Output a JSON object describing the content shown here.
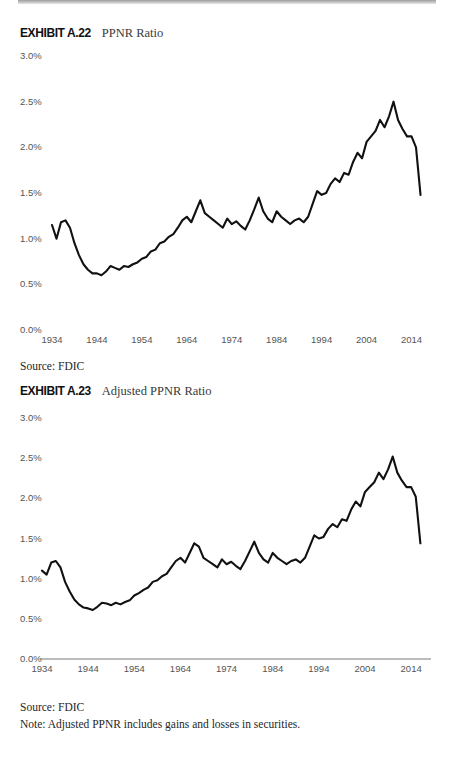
{
  "document": {
    "top_rule": "gray-rule"
  },
  "exhibits": [
    {
      "number": "EXHIBIT A.22",
      "title": "PPNR Ratio",
      "source": "Source: FDIC",
      "note": null
    },
    {
      "number": "EXHIBIT A.23",
      "title": "Adjusted PPNR Ratio",
      "source": "Source: FDIC",
      "note": "Note: Adjusted PPNR includes gains and losses in securities."
    }
  ],
  "chart_data": [
    {
      "type": "line",
      "title": "PPNR Ratio",
      "xlabel": "",
      "ylabel": "",
      "xlim": [
        1934,
        2017
      ],
      "ylim": [
        0.0,
        3.0
      ],
      "ytick_labels": [
        "3.0%",
        "2.5%",
        "2.0%",
        "1.5%",
        "1.0%",
        "0.5%",
        "0.0%"
      ],
      "yticks": [
        3.0,
        2.5,
        2.0,
        1.5,
        1.0,
        0.5,
        0.0
      ],
      "xtick_labels": [
        "1934",
        "1944",
        "1954",
        "1964",
        "1974",
        "1984",
        "1994",
        "2004",
        "2014"
      ],
      "xticks": [
        1934,
        1944,
        1954,
        1964,
        1974,
        1984,
        1994,
        2004,
        2014
      ],
      "grid": false,
      "legend": "none",
      "line_color": "#111111",
      "series": [
        {
          "name": "PPNR Ratio",
          "x": [
            1934,
            1935,
            1936,
            1937,
            1938,
            1939,
            1940,
            1941,
            1942,
            1943,
            1944,
            1945,
            1946,
            1947,
            1948,
            1949,
            1950,
            1951,
            1952,
            1953,
            1954,
            1955,
            1956,
            1957,
            1958,
            1959,
            1960,
            1961,
            1962,
            1963,
            1964,
            1965,
            1966,
            1967,
            1968,
            1969,
            1970,
            1971,
            1972,
            1973,
            1974,
            1975,
            1976,
            1977,
            1978,
            1979,
            1980,
            1981,
            1982,
            1983,
            1984,
            1985,
            1986,
            1987,
            1988,
            1989,
            1990,
            1991,
            1992,
            1993,
            1994,
            1995,
            1996,
            1997,
            1998,
            1999,
            2000,
            2001,
            2002,
            2003,
            2004,
            2005,
            2006,
            2007,
            2008,
            2009,
            2010,
            2011,
            2012,
            2013,
            2014,
            2015,
            2016
          ],
          "values": [
            1.15,
            1.0,
            1.18,
            1.2,
            1.12,
            0.95,
            0.82,
            0.72,
            0.66,
            0.62,
            0.62,
            0.6,
            0.64,
            0.7,
            0.68,
            0.66,
            0.7,
            0.69,
            0.72,
            0.74,
            0.78,
            0.8,
            0.86,
            0.88,
            0.95,
            0.97,
            1.02,
            1.05,
            1.12,
            1.2,
            1.24,
            1.18,
            1.3,
            1.42,
            1.28,
            1.24,
            1.2,
            1.16,
            1.12,
            1.22,
            1.16,
            1.19,
            1.14,
            1.1,
            1.2,
            1.32,
            1.45,
            1.3,
            1.22,
            1.18,
            1.3,
            1.24,
            1.2,
            1.16,
            1.2,
            1.22,
            1.18,
            1.24,
            1.38,
            1.52,
            1.48,
            1.5,
            1.6,
            1.66,
            1.62,
            1.72,
            1.7,
            1.84,
            1.94,
            1.88,
            2.06,
            2.12,
            2.18,
            2.3,
            2.22,
            2.34,
            2.5,
            2.3,
            2.2,
            2.12,
            2.12,
            2.0,
            1.48,
            2.02,
            1.94,
            1.76,
            1.72,
            1.7,
            1.62,
            1.76,
            1.84,
            1.88,
            1.96
          ]
        }
      ]
    },
    {
      "type": "line",
      "title": "Adjusted PPNR Ratio",
      "xlabel": "",
      "ylabel": "",
      "xlim": [
        1934,
        2017
      ],
      "ylim": [
        0.0,
        3.0
      ],
      "ytick_labels": [
        "3.0%",
        "2.5%",
        "2.0%",
        "1.5%",
        "1.0%",
        "0.5%",
        "0.0%"
      ],
      "yticks": [
        3.0,
        2.5,
        2.0,
        1.5,
        1.0,
        0.5,
        0.0
      ],
      "xtick_labels": [
        "1934",
        "1944",
        "1954",
        "1964",
        "1974",
        "1984",
        "1994",
        "2004",
        "2014"
      ],
      "xticks": [
        1934,
        1944,
        1954,
        1964,
        1974,
        1984,
        1994,
        2004,
        2014
      ],
      "grid": false,
      "legend": "none",
      "line_color": "#111111",
      "series": [
        {
          "name": "Adjusted PPNR Ratio",
          "x": [
            1934,
            1935,
            1936,
            1937,
            1938,
            1939,
            1940,
            1941,
            1942,
            1943,
            1944,
            1945,
            1946,
            1947,
            1948,
            1949,
            1950,
            1951,
            1952,
            1953,
            1954,
            1955,
            1956,
            1957,
            1958,
            1959,
            1960,
            1961,
            1962,
            1963,
            1964,
            1965,
            1966,
            1967,
            1968,
            1969,
            1970,
            1971,
            1972,
            1973,
            1974,
            1975,
            1976,
            1977,
            1978,
            1979,
            1980,
            1981,
            1982,
            1983,
            1984,
            1985,
            1986,
            1987,
            1988,
            1989,
            1990,
            1991,
            1992,
            1993,
            1994,
            1995,
            1996,
            1997,
            1998,
            1999,
            2000,
            2001,
            2002,
            2003,
            2004,
            2005,
            2006,
            2007,
            2008,
            2009,
            2010,
            2011,
            2012,
            2013,
            2014,
            2015,
            2016
          ],
          "values": [
            1.1,
            1.05,
            1.2,
            1.22,
            1.14,
            0.96,
            0.84,
            0.74,
            0.68,
            0.64,
            0.63,
            0.61,
            0.65,
            0.7,
            0.69,
            0.67,
            0.7,
            0.68,
            0.71,
            0.73,
            0.79,
            0.82,
            0.86,
            0.89,
            0.96,
            0.98,
            1.03,
            1.06,
            1.14,
            1.22,
            1.26,
            1.2,
            1.32,
            1.44,
            1.4,
            1.26,
            1.22,
            1.18,
            1.14,
            1.24,
            1.18,
            1.21,
            1.16,
            1.12,
            1.22,
            1.34,
            1.46,
            1.32,
            1.24,
            1.2,
            1.32,
            1.26,
            1.22,
            1.18,
            1.22,
            1.24,
            1.2,
            1.26,
            1.4,
            1.54,
            1.5,
            1.52,
            1.62,
            1.68,
            1.64,
            1.74,
            1.72,
            1.86,
            1.96,
            1.9,
            2.08,
            2.14,
            2.2,
            2.32,
            2.24,
            2.36,
            2.52,
            2.32,
            2.22,
            2.14,
            2.14,
            2.02,
            1.44,
            2.04,
            1.92,
            1.74,
            1.7,
            1.68,
            1.64,
            1.78,
            1.86,
            1.9,
            1.98
          ]
        }
      ]
    }
  ]
}
